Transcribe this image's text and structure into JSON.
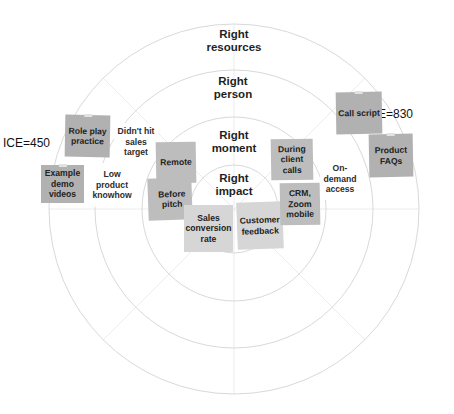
{
  "diagram": {
    "type": "concentric-rings",
    "center": [
      234,
      209
    ],
    "rings": [
      {
        "id": "resources",
        "radius": 185,
        "label_line1": "Right",
        "label_line2": "resources"
      },
      {
        "id": "person",
        "radius": 139,
        "label_line1": "Right",
        "label_line2": "person"
      },
      {
        "id": "moment",
        "radius": 92,
        "label_line1": "Right",
        "label_line2": "moment"
      },
      {
        "id": "impact",
        "radius": 44,
        "label_line1": "Right",
        "label_line2": "impact"
      }
    ],
    "colors": {
      "ring_stroke": "#dcdcdc",
      "spoke_stroke": "#ececec",
      "note_dark": "#b1b1b1",
      "note_mid": "#bdbdbd",
      "note_light": "#d6d6d6"
    },
    "ice_scores": [
      {
        "id": "left",
        "label": "ICE=450"
      },
      {
        "id": "right",
        "label": "ICE=830"
      }
    ],
    "notes": [
      {
        "id": "role-play-practice",
        "text": "Role play practice",
        "ring": "person",
        "side": "left"
      },
      {
        "id": "didnt-hit-sales-target",
        "text": "Didn't hit sales target",
        "ring": "person",
        "side": "left"
      },
      {
        "id": "example-demo-videos",
        "text": "Example demo videos",
        "ring": "resources",
        "side": "left"
      },
      {
        "id": "low-product-knowhow",
        "text": "Low product knowhow",
        "ring": "person",
        "side": "left"
      },
      {
        "id": "remote",
        "text": "Remote",
        "ring": "moment",
        "side": "left"
      },
      {
        "id": "before-pitch",
        "text": "Before pitch",
        "ring": "moment",
        "side": "left"
      },
      {
        "id": "sales-conversion-rate",
        "text": "Sales conversion rate",
        "ring": "impact",
        "side": "left"
      },
      {
        "id": "customer-feedback",
        "text": "Customer feedback",
        "ring": "impact",
        "side": "right"
      },
      {
        "id": "during-client-calls",
        "text": "During client calls",
        "ring": "moment",
        "side": "right"
      },
      {
        "id": "crm-zoom-mobile",
        "text": "CRM, Zoom mobile",
        "ring": "moment",
        "side": "right"
      },
      {
        "id": "on-demand-access",
        "text": "On-demand access",
        "ring": "person",
        "side": "right"
      },
      {
        "id": "call-script",
        "text": "Call script",
        "ring": "resources",
        "side": "right"
      },
      {
        "id": "product-faqs",
        "text": "Product FAQs",
        "ring": "resources",
        "side": "right"
      }
    ]
  }
}
